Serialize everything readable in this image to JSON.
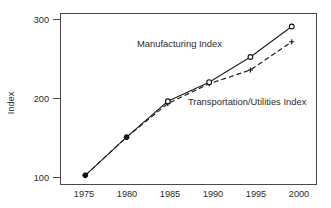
{
  "chart_data": {
    "type": "line",
    "title": "",
    "xlabel": "",
    "ylabel": "Index",
    "x": [
      1975,
      1980,
      1985,
      1990,
      1995,
      2000
    ],
    "categories": [
      "1975",
      "1980",
      "1985",
      "1990",
      "1995",
      "2000"
    ],
    "xlim": [
      1972,
      2003
    ],
    "ylim": [
      88,
      312
    ],
    "xticks": [
      "1975",
      "1980",
      "1985",
      "1990",
      "1995",
      "2000"
    ],
    "yticks": [
      "100",
      "200",
      "300"
    ],
    "ytick_values": [
      100,
      200,
      300
    ],
    "grid": false,
    "legend": "inline-annotations",
    "series": [
      {
        "name": "Manufacturing Index",
        "values": [
          100,
          150,
          197,
          222,
          255,
          295
        ],
        "line_style": "solid",
        "marker": "circle-open",
        "color": "#1c1c1c"
      },
      {
        "name": "Transportation/Utilities Index",
        "values": [
          100,
          150,
          194,
          220,
          238,
          275
        ],
        "line_style": "dashed",
        "marker": "cross",
        "color": "#1c1c1c"
      }
    ],
    "annotations": [
      {
        "text": "Manufacturing Index",
        "x": 1986.4,
        "y": 268,
        "anchor": "middle"
      },
      {
        "text": "Transportation/Utilities Index",
        "x": 1994.6,
        "y": 192,
        "anchor": "middle"
      }
    ]
  },
  "axes": {
    "y_title": "Index"
  }
}
